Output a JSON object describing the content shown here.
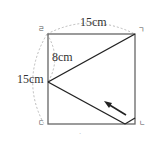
{
  "figure": {
    "shape": "square",
    "corners": {
      "top_left": "ㄹ",
      "top_right": "ㄱ",
      "bottom_left": "ㄷ",
      "bottom_right": "ㄴ"
    },
    "labels": {
      "top_side": "15cm",
      "left_side": "15cm",
      "segment": "8cm"
    },
    "bottom_mark": "·"
  }
}
